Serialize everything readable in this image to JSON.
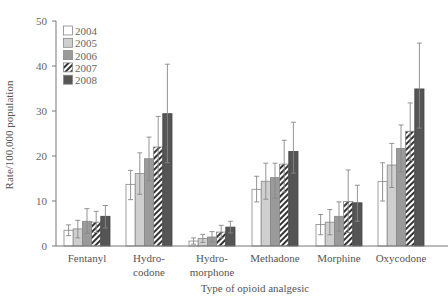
{
  "chart_data": {
    "type": "bar",
    "title": "",
    "xlabel": "Type of opioid analgesic",
    "ylabel": "Rate/100,000 population",
    "ylim": [
      0,
      50
    ],
    "yticks": [
      0,
      10,
      20,
      30,
      40,
      50
    ],
    "grid": false,
    "legend_position": "upper-left",
    "categories": [
      [
        "Fentanyl"
      ],
      [
        "Hydro-",
        "codone"
      ],
      [
        "Hydro-",
        "morphone"
      ],
      [
        "Methadone"
      ],
      [
        "Morphine"
      ],
      [
        "Oxycodone"
      ]
    ],
    "series": [
      {
        "name": "2004",
        "fill": "#ffffff",
        "pattern": "solid",
        "values": [
          3.5,
          13.7,
          1.1,
          12.6,
          4.8,
          14.3
        ],
        "err_low": [
          2.3,
          10.3,
          0.4,
          9.8,
          2.5,
          10.0
        ],
        "err_high": [
          4.7,
          16.8,
          1.8,
          15.5,
          7.0,
          18.5
        ]
      },
      {
        "name": "2005",
        "fill": "#cfcfcf",
        "pattern": "solid",
        "values": [
          3.8,
          16.1,
          1.7,
          14.4,
          5.3,
          18.0
        ],
        "err_low": [
          1.8,
          11.5,
          0.8,
          10.4,
          2.5,
          13.0
        ],
        "err_high": [
          5.7,
          20.7,
          2.6,
          18.4,
          8.1,
          22.8
        ]
      },
      {
        "name": "2006",
        "fill": "#9a9a9a",
        "pattern": "solid",
        "values": [
          5.5,
          19.4,
          2.0,
          15.2,
          6.6,
          21.7
        ],
        "err_low": [
          2.8,
          14.5,
          0.9,
          10.6,
          3.3,
          16.5
        ],
        "err_high": [
          8.3,
          24.2,
          3.2,
          18.4,
          9.8,
          26.9
        ]
      },
      {
        "name": "2007",
        "fill": "#ffffff",
        "pattern": "hatch",
        "values": [
          5.3,
          22.0,
          3.1,
          18.2,
          9.9,
          25.5
        ],
        "err_low": [
          3.0,
          15.2,
          1.8,
          12.0,
          3.0,
          19.0
        ],
        "err_high": [
          7.7,
          28.8,
          4.6,
          23.5,
          16.9,
          31.8
        ]
      },
      {
        "name": "2008",
        "fill": "#555555",
        "pattern": "solid",
        "values": [
          6.6,
          29.4,
          4.2,
          21.0,
          9.6,
          34.9
        ],
        "err_low": [
          4.0,
          18.5,
          2.9,
          16.2,
          5.5,
          26.2
        ],
        "err_high": [
          9.0,
          40.4,
          5.5,
          27.5,
          13.5,
          45.1
        ]
      }
    ]
  }
}
